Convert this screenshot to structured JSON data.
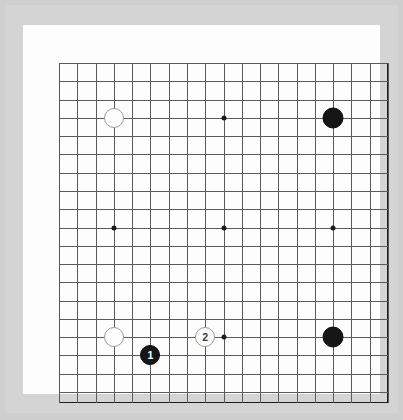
{
  "board": {
    "title": "Go Board Diagram",
    "size": 19,
    "star_point_lines": [
      4,
      10,
      16
    ],
    "colors": {
      "mat": "#cfcfcf",
      "mat_shade": "#d4d4d4",
      "board_surface": "#fdfdfd",
      "grid_line": "#5a5a5a",
      "grid_border": "#1c1c1c",
      "black_stone": "#161616",
      "white_stone": "#fdfdfd",
      "white_stone_edge": "#9a9a9a",
      "star_point": "#1c1c1c"
    },
    "star_points": [
      {
        "name": "star-point-top-left",
        "col": 4,
        "row": 4
      },
      {
        "name": "star-point-top-center",
        "col": 10,
        "row": 4
      },
      {
        "name": "star-point-top-right",
        "col": 16,
        "row": 4
      },
      {
        "name": "star-point-middle-left",
        "col": 4,
        "row": 10
      },
      {
        "name": "star-point-tengen",
        "col": 10,
        "row": 10
      },
      {
        "name": "star-point-middle-right",
        "col": 16,
        "row": 10
      },
      {
        "name": "star-point-bottom-left",
        "col": 4,
        "row": 16
      },
      {
        "name": "star-point-bottom-center",
        "col": 10,
        "row": 16
      },
      {
        "name": "star-point-bottom-right",
        "col": 16,
        "row": 16
      }
    ],
    "hidden_star_points": [
      "star-point-top-left",
      "star-point-top-right",
      "star-point-bottom-left",
      "star-point-bottom-right"
    ],
    "stones": [
      {
        "name": "stone-white-top-left",
        "color": "white",
        "col": 4,
        "row": 4,
        "label": "",
        "diameter": 20
      },
      {
        "name": "stone-black-top-right",
        "color": "black",
        "col": 16,
        "row": 4,
        "label": "",
        "diameter": 21
      },
      {
        "name": "stone-white-bottom-left",
        "color": "white",
        "col": 4,
        "row": 16,
        "label": "",
        "diameter": 20
      },
      {
        "name": "stone-black-move-1",
        "color": "black",
        "col": 6,
        "row": 17,
        "label": "1",
        "diameter": 20
      },
      {
        "name": "stone-white-move-2",
        "color": "white",
        "col": 9,
        "row": 16,
        "label": "2",
        "diameter": 20
      },
      {
        "name": "stone-black-bottom-right",
        "color": "black",
        "col": 16,
        "row": 16,
        "label": "",
        "diameter": 21
      }
    ]
  },
  "geometry": {
    "grid_left": 36,
    "grid_top": 38,
    "cell": 18.28
  }
}
